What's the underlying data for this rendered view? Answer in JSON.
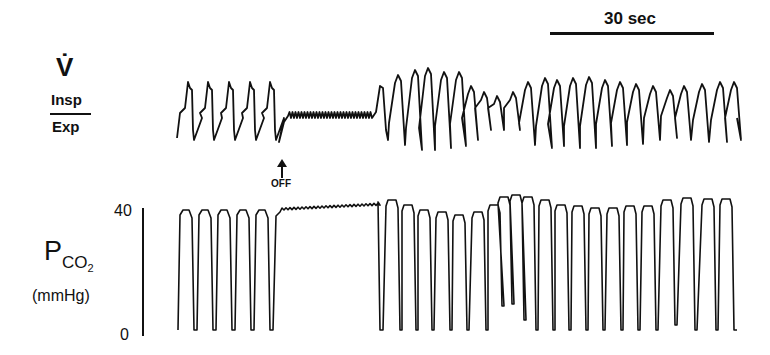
{
  "chart_data": [
    {
      "type": "line",
      "title": "",
      "trace": "flow",
      "ylabel": "V̇",
      "ylabel_top": "Insp",
      "ylabel_bottom": "Exp",
      "annotation": {
        "label": "OFF",
        "marker": "up-arrow",
        "x_fraction": 0.188
      },
      "segments": [
        {
          "phase": "pre-OFF",
          "cycles": 5,
          "pattern": "regular sawtooth breaths"
        },
        {
          "phase": "OFF (apnea)",
          "pattern": "flat line with small high-frequency oscillations",
          "duration_fraction": 0.17
        },
        {
          "phase": "recovery",
          "cycles": 25,
          "pattern": "large breaths then smaller irregular, then regular breathing"
        }
      ]
    },
    {
      "type": "line",
      "trace": "PCO2",
      "ylabel": "PCO2",
      "yunit": "(mmHg)",
      "ylim": [
        0,
        40
      ],
      "yticks": [
        "40",
        "0"
      ],
      "segments": [
        {
          "phase": "pre-OFF",
          "cycles": 5,
          "range_mmHg": [
            0,
            38
          ]
        },
        {
          "phase": "OFF (apnea)",
          "pattern": "plateau rising slowly",
          "range_mmHg": [
            37,
            40
          ]
        },
        {
          "phase": "recovery",
          "cycles": 25,
          "range_mmHg": [
            0,
            40
          ]
        }
      ]
    }
  ],
  "scale_bar": {
    "label": "30 sec"
  },
  "labels": {
    "flow_symbol": "V̇",
    "insp": "Insp",
    "exp": "Exp",
    "pco2_main": "P",
    "pco2_sub": "CO",
    "pco2_sub2": "2",
    "pco2_unit": "(mmHg)",
    "tick_top": "40",
    "tick_bottom": "0",
    "off": "OFF"
  },
  "colors": {
    "trace": "#111111",
    "background": "#ffffff"
  }
}
